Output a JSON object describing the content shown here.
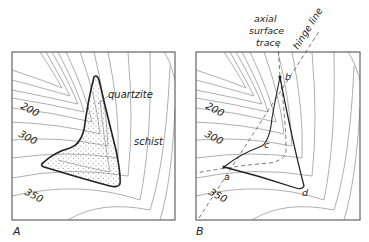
{
  "figure": {
    "panels": [
      {
        "id": "A",
        "label": "A",
        "rock_units": {
          "outcrop_unit": "quartzite",
          "host_unit": "schist"
        },
        "contour_labels": [
          "200",
          "300",
          "350"
        ]
      },
      {
        "id": "B",
        "label": "B",
        "contour_labels": [
          "200",
          "300",
          "350"
        ],
        "point_labels": [
          "a",
          "b",
          "c",
          "d"
        ],
        "annotations": {
          "axial_surface_trace_line1": "axial",
          "axial_surface_trace_line2": "surface",
          "axial_surface_trace_line3": "trace",
          "hinge_line": "hinge line"
        }
      }
    ],
    "colors": {
      "contour": "#9a9a9a",
      "outline": "#222222",
      "frame": "#555555",
      "background": "#ffffff"
    }
  }
}
